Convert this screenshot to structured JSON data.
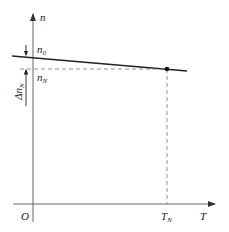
{
  "diagram": {
    "axes": {
      "y_label": "n",
      "x_label": "T",
      "origin_label": "O"
    },
    "labels": {
      "n0": {
        "base": "n",
        "sub": "0"
      },
      "nN": {
        "base": "n",
        "sub": "N"
      },
      "TN": {
        "base": "T",
        "sub": "N"
      },
      "delta_nN": {
        "prefix": "Δ",
        "base": "n",
        "sub": "N"
      }
    },
    "colors": {
      "line": "#222222",
      "axis": "#555555",
      "dashed": "#666666"
    }
  }
}
